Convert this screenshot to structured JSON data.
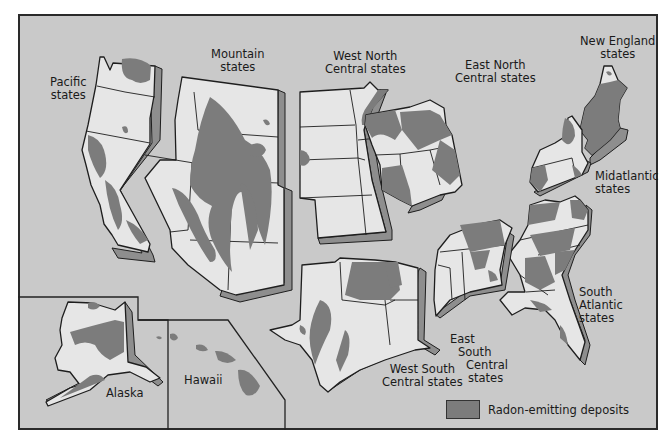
{
  "map": {
    "title": "",
    "colors": {
      "background": "#c9c9c9",
      "state_fill": "#e6e6e6",
      "deposit_fill": "#7c7c7c",
      "shadow": "#8e8e8e",
      "border": "#222222"
    },
    "regions": [
      {
        "id": "pacific",
        "label_lines": [
          "Pacific",
          "states"
        ]
      },
      {
        "id": "mountain",
        "label_lines": [
          "Mountain",
          "states"
        ]
      },
      {
        "id": "west-north-central",
        "label_lines": [
          "West North",
          "Central states"
        ]
      },
      {
        "id": "east-north-central",
        "label_lines": [
          "East North",
          "Central states"
        ]
      },
      {
        "id": "new-england",
        "label_lines": [
          "New England",
          "states"
        ]
      },
      {
        "id": "midatlantic",
        "label_lines": [
          "Midatlantic",
          "states"
        ]
      },
      {
        "id": "south-atlantic",
        "label_lines": [
          "South",
          "Atlantic",
          "states"
        ]
      },
      {
        "id": "east-south-central",
        "label_lines": [
          "East",
          "South",
          "Central",
          "states"
        ]
      },
      {
        "id": "west-south-central",
        "label_lines": [
          "West South",
          "Central states"
        ]
      },
      {
        "id": "alaska",
        "label_lines": [
          "Alaska"
        ]
      },
      {
        "id": "hawaii",
        "label_lines": [
          "Hawaii"
        ]
      }
    ],
    "legend": {
      "items": [
        {
          "label": "Radon-emitting deposits",
          "color": "#7c7c7c"
        }
      ]
    }
  }
}
